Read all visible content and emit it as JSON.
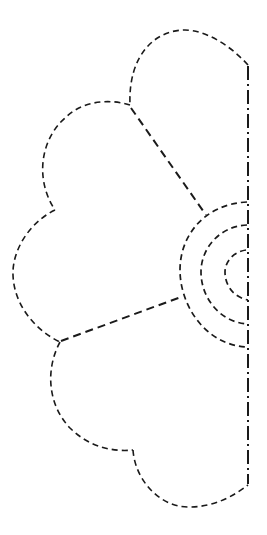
{
  "figure": {
    "title": "",
    "parts": {
      "petals": [
        "top-petal",
        "upper-petal",
        "middle-petal",
        "lower-petal",
        "bottom-petal"
      ],
      "center_rings": 3,
      "fold_line": "dash-dot"
    },
    "colors": {
      "stroke": "#1a1a1a",
      "background": "#ffffff"
    }
  }
}
